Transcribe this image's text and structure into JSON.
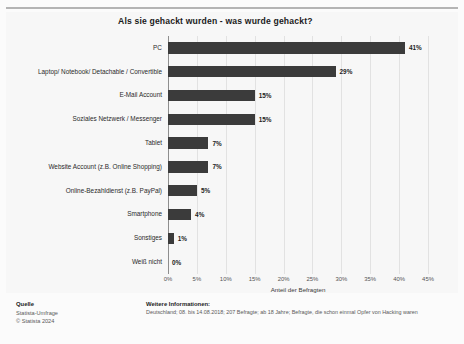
{
  "chart_data": {
    "type": "bar",
    "orientation": "horizontal",
    "title": "Als sie gehackt wurden - was wurde gehackt?",
    "xlabel": "Anteil der Befragten",
    "ylabel": "",
    "xlim": [
      0,
      45
    ],
    "grid": true,
    "legend": "none",
    "bar_color": "#3b3b3b",
    "categories": [
      "PC",
      "Laptop/ Notebook/ Detachable / Convertible",
      "E-Mail Account",
      "Soziales Netzwerk / Messenger",
      "Tablet",
      "Website Account (z.B. Online Shopping)",
      "Online-Bezahldienst (z.B. PayPal)",
      "Smartphone",
      "Sonstiges",
      "Weiß nicht"
    ],
    "values": [
      41,
      29,
      15,
      15,
      7,
      7,
      5,
      4,
      1,
      0
    ],
    "data_labels": [
      "41%",
      "29%",
      "15%",
      "15%",
      "7%",
      "7%",
      "5%",
      "4%",
      "1%",
      "0%"
    ],
    "x_ticks": [
      0,
      5,
      10,
      15,
      20,
      25,
      30,
      35,
      40,
      45
    ],
    "x_tick_labels": [
      "0%",
      "5%",
      "10%",
      "15%",
      "20%",
      "25%",
      "30%",
      "35%",
      "40%",
      "45%"
    ]
  },
  "footer": {
    "source_heading": "Quelle",
    "source_line1": "Statista-Umfrage",
    "source_line2": "© Statista 2024",
    "notes_heading": "Weitere Informationen:",
    "notes_line": "Deutschland; 08. bis 14.08.2018; 207 Befragte; ab 18 Jahre; Befragte, die schon einmal Opfer von Hacking waren"
  }
}
